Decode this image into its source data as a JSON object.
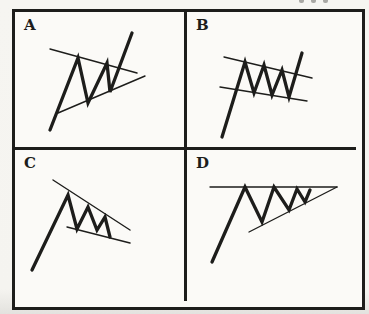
{
  "page": {
    "ink": "#1d1d1b",
    "paper": "#fbfaf7",
    "description_artifact": "cropped print fragment at top edge of scan"
  },
  "panels": [
    {
      "label": "A",
      "figure": "bull-pennant-upward-breakout",
      "strokes": [
        {
          "name": "price-path",
          "width": 3.3,
          "points": [
            [
              35,
              118
            ],
            [
              63,
              46
            ],
            [
              73,
              91
            ],
            [
              92,
              51
            ],
            [
              95,
              80
            ],
            [
              117,
              21
            ]
          ]
        },
        {
          "name": "upper-trendline",
          "width": 1.4,
          "points": [
            [
              35,
              37
            ],
            [
              122,
              61
            ]
          ]
        },
        {
          "name": "lower-trendline",
          "width": 1.4,
          "points": [
            [
              43,
              101
            ],
            [
              130,
              64
            ]
          ]
        }
      ]
    },
    {
      "label": "B",
      "figure": "bull-flag-upward-breakout",
      "strokes": [
        {
          "name": "price-path",
          "width": 3.3,
          "points": [
            [
              35,
              125
            ],
            [
              58,
              50
            ],
            [
              67,
              81
            ],
            [
              77,
              53
            ],
            [
              85,
              83
            ],
            [
              95,
              58
            ],
            [
              102,
              85
            ],
            [
              115,
              41
            ]
          ]
        },
        {
          "name": "upper-trendline",
          "width": 1.4,
          "points": [
            [
              37,
              45
            ],
            [
              125,
              66
            ]
          ]
        },
        {
          "name": "lower-trendline",
          "width": 1.4,
          "points": [
            [
              33,
              75
            ],
            [
              120,
              89
            ]
          ]
        }
      ]
    },
    {
      "label": "C",
      "figure": "pole-with-falling-wedge",
      "strokes": [
        {
          "name": "price-path",
          "width": 3.3,
          "points": [
            [
              17,
              120
            ],
            [
              53,
              45
            ],
            [
              62,
              79
            ],
            [
              73,
              57
            ],
            [
              82,
              80
            ],
            [
              90,
              67
            ],
            [
              95,
              87
            ]
          ]
        },
        {
          "name": "upper-trendline",
          "width": 1.4,
          "points": [
            [
              38,
              30
            ],
            [
              115,
              80
            ]
          ]
        },
        {
          "name": "lower-trendline",
          "width": 1.4,
          "points": [
            [
              52,
              77
            ],
            [
              115,
              93
            ]
          ]
        }
      ]
    },
    {
      "label": "D",
      "figure": "ascending-triangle",
      "strokes": [
        {
          "name": "price-path",
          "width": 3.3,
          "points": [
            [
              25,
              112
            ],
            [
              58,
              37
            ],
            [
              75,
              72
            ],
            [
              87,
              37
            ],
            [
              102,
              60
            ],
            [
              110,
              39
            ],
            [
              118,
              52
            ],
            [
              123,
              40
            ]
          ]
        },
        {
          "name": "upper-trendline",
          "width": 1.4,
          "points": [
            [
              23,
              37
            ],
            [
              150,
              37
            ]
          ]
        },
        {
          "name": "lower-trendline",
          "width": 1.4,
          "points": [
            [
              62,
              82
            ],
            [
              150,
              37
            ]
          ]
        }
      ]
    }
  ]
}
